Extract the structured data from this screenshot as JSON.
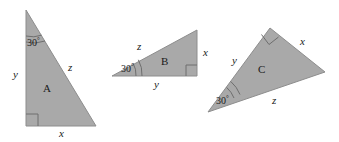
{
  "figure": {
    "background_color": "#ffffff",
    "fill_color": "#a9a9a9",
    "stroke_color": "#8d8d8d",
    "text_color": "#1a1a1a",
    "width": 339,
    "height": 142
  },
  "triangles": [
    {
      "name": "A",
      "label": "A",
      "angle_label": "30",
      "angle_degree_symbol": "°",
      "angle_value": 30,
      "right_angle_vertex": "bottom-left",
      "sides": {
        "vertical": "y",
        "horizontal": "x",
        "hypotenuse": "z"
      },
      "vertices": [
        [
          26,
          10
        ],
        [
          26,
          126
        ],
        [
          96,
          126
        ]
      ]
    },
    {
      "name": "B",
      "label": "B",
      "angle_label": "30",
      "angle_degree_symbol": "°",
      "angle_value": 30,
      "right_angle_vertex": "bottom-right",
      "sides": {
        "vertical": "x",
        "horizontal": "y",
        "hypotenuse": "z"
      },
      "vertices": [
        [
          112,
          76
        ],
        [
          197,
          30
        ],
        [
          197,
          76
        ]
      ]
    },
    {
      "name": "C",
      "label": "C",
      "angle_label": "30",
      "angle_degree_symbol": "°",
      "angle_value": 30,
      "right_angle_vertex": "top",
      "sides": {
        "upper_left": "y",
        "upper_right": "x",
        "base": "z"
      },
      "vertices": [
        [
          208,
          112
        ],
        [
          270,
          28
        ],
        [
          325,
          72
        ]
      ]
    }
  ],
  "labels": [
    {
      "id": "a-angle",
      "text": "30",
      "sup": "°",
      "x": 27,
      "y": 37,
      "kind": "angle",
      "triangle": "A"
    },
    {
      "id": "a-side-y",
      "text": "y",
      "x": 13,
      "y": 69,
      "kind": "var",
      "triangle": "A"
    },
    {
      "id": "a-side-z",
      "text": "z",
      "x": 68,
      "y": 62,
      "kind": "var",
      "triangle": "A"
    },
    {
      "id": "a-name",
      "text": "A",
      "x": 43,
      "y": 83,
      "kind": "name",
      "triangle": "A"
    },
    {
      "id": "a-side-x",
      "text": "x",
      "x": 59,
      "y": 128,
      "kind": "var",
      "triangle": "A"
    },
    {
      "id": "b-angle",
      "text": "30",
      "sup": "°",
      "x": 121,
      "y": 63,
      "kind": "angle",
      "triangle": "B"
    },
    {
      "id": "b-side-z",
      "text": "z",
      "x": 137,
      "y": 41,
      "kind": "var",
      "triangle": "B"
    },
    {
      "id": "b-name",
      "text": "B",
      "x": 161,
      "y": 56,
      "kind": "name",
      "triangle": "B"
    },
    {
      "id": "b-side-x",
      "text": "x",
      "x": 203,
      "y": 47,
      "kind": "var",
      "triangle": "B"
    },
    {
      "id": "b-side-y",
      "text": "y",
      "x": 154,
      "y": 79,
      "kind": "var",
      "triangle": "B"
    },
    {
      "id": "c-angle",
      "text": "30",
      "sup": "°",
      "x": 216,
      "y": 95,
      "kind": "angle",
      "triangle": "C"
    },
    {
      "id": "c-side-y",
      "text": "y",
      "x": 232,
      "y": 55,
      "kind": "var",
      "triangle": "C"
    },
    {
      "id": "c-name",
      "text": "C",
      "x": 258,
      "y": 64,
      "kind": "name",
      "triangle": "C"
    },
    {
      "id": "c-side-x",
      "text": "x",
      "x": 300,
      "y": 36,
      "kind": "var",
      "triangle": "C"
    },
    {
      "id": "c-side-z",
      "text": "z",
      "x": 272,
      "y": 95,
      "kind": "var",
      "triangle": "C"
    }
  ]
}
